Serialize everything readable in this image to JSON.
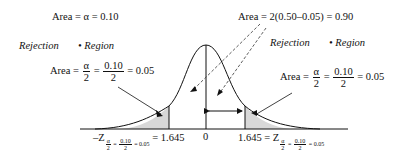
{
  "diagram": {
    "type": "two-tailed normal distribution",
    "labels": {
      "area_alpha": "Area = α = 0.10",
      "area_center": "Area = 2(0.50–0.05) = 0.90",
      "rejection_left": "Rejection",
      "region_left": "• Region",
      "rejection_right": "Rejection",
      "region_right": "• Region",
      "area_prefix": "Area =",
      "alpha": "α",
      "two": "2",
      "tenth": "0.10",
      "eq": "=",
      "tail_value": "= 0.05",
      "zero": "0",
      "neg_z": "–Z",
      "z": "Z",
      "left_z_value": "= 1.645",
      "right_z_value": "1.645 =",
      "sub_alpha": "α",
      "sub_two": "2",
      "sub_eq": "=",
      "sub_tenth": "0.10",
      "sub_val": "= 0.05"
    },
    "values": {
      "alpha": 0.1,
      "tail_area": 0.05,
      "center_area": 0.9,
      "critical_z": 1.645
    },
    "colors": {
      "line": "#111111",
      "tail_fill": "#d8d8d8",
      "dashed": "#333333"
    }
  }
}
